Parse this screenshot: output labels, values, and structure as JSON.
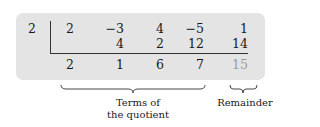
{
  "divisor": "2",
  "rows": {
    "coefficients": [
      "2",
      "−3",
      "4",
      "−5",
      "1"
    ],
    "products": [
      "",
      "4",
      "2",
      "12",
      "14"
    ],
    "results": [
      "2",
      "1",
      "6",
      "7",
      "15"
    ]
  },
  "labels": {
    "quotient_line1": "Terms of",
    "quotient_line2": "the quotient",
    "remainder": "Remainder"
  },
  "colors": {
    "panel": "#e4e4e4",
    "text": "#1a1a1a",
    "remainder": "#9a9a9a"
  }
}
